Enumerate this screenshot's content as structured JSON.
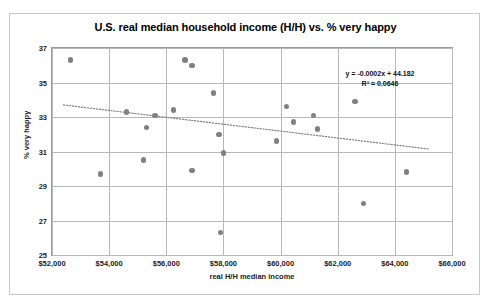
{
  "chart_data": {
    "type": "scatter",
    "title": "U.S. real median household income (H/H) vs. % very happy",
    "xlabel": "real H/H median income",
    "ylabel": "% very happy",
    "xlim": [
      52000,
      66000
    ],
    "ylim": [
      25,
      37
    ],
    "xticks": [
      52000,
      54000,
      56000,
      58000,
      60000,
      62000,
      64000,
      66000
    ],
    "xtick_labels": [
      "$52,000",
      "$54,000",
      "$56,000",
      "$58,000",
      "$60,000",
      "$62,000",
      "$64,000",
      "$66,000"
    ],
    "yticks": [
      25,
      27,
      29,
      31,
      33,
      35,
      37
    ],
    "ytick_labels": [
      "25",
      "27",
      "29",
      "31",
      "33",
      "35",
      "37"
    ],
    "grid": true,
    "legend": "none",
    "marker_color": "#808080",
    "trendline": {
      "visible": true,
      "style": "dotted",
      "color": "#7f7f7f",
      "slope": -0.0002,
      "intercept": 44.182,
      "equation_label": "y = -0.0002x + 44.182",
      "r2_label": "R² = 0.0646",
      "r2_value": 0.0646
    },
    "points": [
      {
        "x": 52640,
        "y": 36.3
      },
      {
        "x": 54600,
        "y": 33.3
      },
      {
        "x": 55300,
        "y": 32.4
      },
      {
        "x": 55600,
        "y": 33.1
      },
      {
        "x": 56250,
        "y": 33.4
      },
      {
        "x": 56650,
        "y": 36.3
      },
      {
        "x": 56900,
        "y": 36.0
      },
      {
        "x": 57650,
        "y": 34.4
      },
      {
        "x": 53700,
        "y": 29.7
      },
      {
        "x": 55200,
        "y": 30.5
      },
      {
        "x": 56900,
        "y": 29.9
      },
      {
        "x": 58000,
        "y": 30.9
      },
      {
        "x": 57900,
        "y": 26.3
      },
      {
        "x": 57850,
        "y": 32.0
      },
      {
        "x": 59850,
        "y": 31.6
      },
      {
        "x": 60200,
        "y": 33.6
      },
      {
        "x": 60450,
        "y": 32.7
      },
      {
        "x": 61150,
        "y": 33.1
      },
      {
        "x": 61300,
        "y": 32.3
      },
      {
        "x": 62600,
        "y": 33.9
      },
      {
        "x": 62900,
        "y": 28.0
      },
      {
        "x": 64400,
        "y": 29.8
      }
    ]
  }
}
